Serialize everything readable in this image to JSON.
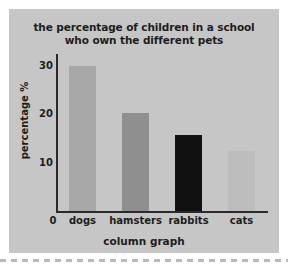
{
  "chart_data": {
    "type": "bar",
    "title": "the percentage of children in a school who own the different pets",
    "title_line1": "the percentage of children in a school",
    "title_line2": "who own the different pets",
    "xlabel": "column graph",
    "ylabel": "percentage %",
    "categories": [
      "dogs",
      "hamsters",
      "rabbits",
      "cats"
    ],
    "values": [
      30,
      20.3,
      15.8,
      12.5
    ],
    "bar_colors": [
      "#a8a8a8",
      "#8f8f8f",
      "#111111",
      "#bdbdbd"
    ],
    "ylim": [
      0,
      31
    ],
    "yticks": [
      0,
      10,
      20,
      30
    ],
    "ytick_labels": [
      "0",
      "10",
      "20",
      "30"
    ],
    "grid": false,
    "legend": "none",
    "axis_color": "#2a2a2a",
    "background_color": "#c6c6c6",
    "text_color": "#1d1d1d"
  }
}
